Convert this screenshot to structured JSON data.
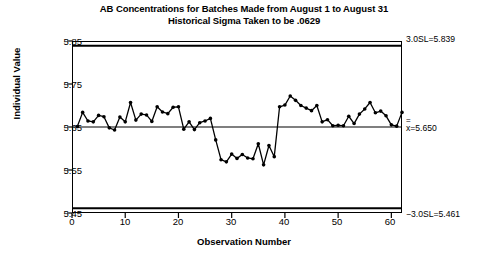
{
  "chart_data": {
    "type": "line",
    "title": "AB Concentrations for Batches Made from August 1 to August 31",
    "subtitle": "Historical Sigma Taken to be .0629",
    "xlabel": "Observation Number",
    "ylabel": "Individual Value",
    "xlim": [
      0,
      62
    ],
    "ylim": [
      5.45,
      5.85
    ],
    "xticks": [
      0,
      10,
      20,
      30,
      40,
      50,
      60
    ],
    "yticks": [
      5.45,
      5.55,
      5.65,
      5.75,
      5.85
    ],
    "grid": false,
    "legend": null,
    "marker": "filled-circle",
    "line_color": "#000000",
    "control_limits": {
      "upper_label": "3.0SL=5.839",
      "upper_value": 5.839,
      "center_label": "=5.650",
      "center_symbol": "x",
      "center_value": 5.65,
      "lower_label": "−3.0SL=5.461",
      "lower_value": 5.461,
      "sigma": 0.0629
    },
    "x": [
      1,
      2,
      3,
      4,
      5,
      6,
      7,
      8,
      9,
      10,
      11,
      12,
      13,
      14,
      15,
      16,
      17,
      18,
      19,
      20,
      21,
      22,
      23,
      24,
      25,
      26,
      27,
      28,
      29,
      30,
      31,
      32,
      33,
      34,
      35,
      36,
      37,
      38,
      39,
      40,
      41,
      42,
      43,
      44,
      45,
      46,
      47,
      48,
      49,
      50,
      51,
      52,
      53,
      54,
      55,
      56,
      57,
      58,
      59,
      60,
      61,
      62
    ],
    "values": [
      5.651,
      5.684,
      5.664,
      5.662,
      5.677,
      5.674,
      5.648,
      5.643,
      5.673,
      5.662,
      5.707,
      5.666,
      5.68,
      5.678,
      5.663,
      5.697,
      5.685,
      5.681,
      5.696,
      5.697,
      5.645,
      5.662,
      5.644,
      5.66,
      5.664,
      5.67,
      5.62,
      5.574,
      5.569,
      5.587,
      5.577,
      5.586,
      5.578,
      5.576,
      5.611,
      5.562,
      5.607,
      5.581,
      5.697,
      5.701,
      5.722,
      5.712,
      5.7,
      5.694,
      5.688,
      5.7,
      5.662,
      5.667,
      5.653,
      5.654,
      5.653,
      5.675,
      5.658,
      5.68,
      5.692,
      5.707,
      5.683,
      5.687,
      5.676,
      5.655,
      5.652,
      5.684
    ]
  }
}
